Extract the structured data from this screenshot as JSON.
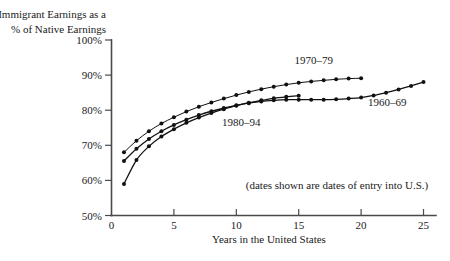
{
  "chart_data": {
    "type": "line",
    "title": "",
    "title_lines": [
      "Immigrant Earnings as a",
      "% of Native Earnings"
    ],
    "ylabel": "Immigrant Earnings as a % of Native Earnings",
    "xlabel": "Years in the United States",
    "annotation": "(dates shown are dates of entry into U.S.)",
    "xlim": [
      0,
      26
    ],
    "ylim": [
      50,
      100
    ],
    "xticks": [
      0,
      5,
      10,
      15,
      20,
      25
    ],
    "xtick_labels": [
      "0",
      "5",
      "10",
      "15",
      "20",
      "25"
    ],
    "yticks": [
      50,
      60,
      70,
      80,
      90,
      100
    ],
    "ytick_labels": [
      "50%",
      "60%",
      "70%",
      "80%",
      "90%",
      "100%"
    ],
    "grid": false,
    "legend_position": "inline-annotations",
    "line_color": "#111111",
    "axis_color": "#4a4a4a",
    "series": [
      {
        "name": "1960-69",
        "label": "1960–69",
        "label_x": 22.1,
        "label_y": 81.2,
        "x": [
          1,
          2,
          3,
          4,
          5,
          6,
          7,
          8,
          9,
          10,
          11,
          12,
          13,
          14,
          15,
          16,
          17,
          18,
          19,
          20,
          21,
          22,
          23,
          24,
          25
        ],
        "values": [
          65.5,
          69.0,
          71.8,
          74.0,
          75.8,
          77.3,
          78.6,
          79.7,
          80.6,
          81.4,
          82.0,
          82.5,
          82.8,
          83.0,
          83.0,
          83.0,
          83.0,
          83.1,
          83.3,
          83.6,
          84.2,
          85.0,
          85.9,
          86.9,
          88.0
        ]
      },
      {
        "name": "1970-79",
        "label": "1970–79",
        "label_x": 16.2,
        "label_y": 93.3,
        "x": [
          1,
          2,
          3,
          4,
          5,
          6,
          7,
          8,
          9,
          10,
          11,
          12,
          13,
          14,
          15,
          16,
          17,
          18,
          19,
          20
        ],
        "values": [
          68.0,
          71.3,
          74.0,
          76.2,
          78.0,
          79.6,
          81.0,
          82.2,
          83.3,
          84.3,
          85.2,
          86.0,
          86.7,
          87.3,
          87.8,
          88.2,
          88.5,
          88.8,
          89.0,
          89.1
        ]
      },
      {
        "name": "1980-94",
        "label": "1980–94",
        "label_x": 10.4,
        "label_y": 75.6,
        "x": [
          1,
          2,
          3,
          4,
          5,
          6,
          7,
          8,
          9,
          10,
          11,
          12,
          13,
          14,
          15
        ],
        "values": [
          59.0,
          65.8,
          69.7,
          72.5,
          74.6,
          76.4,
          77.9,
          79.2,
          80.3,
          81.3,
          82.1,
          82.8,
          83.4,
          83.8,
          84.1
        ]
      }
    ]
  }
}
